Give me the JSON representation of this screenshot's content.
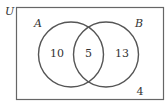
{
  "diagram": {
    "type": "venn",
    "universe": {
      "label": "U",
      "outside_count": "4"
    },
    "sets": [
      {
        "name": "A",
        "only_count": "10"
      },
      {
        "name": "B",
        "only_count": "13"
      }
    ],
    "intersection": {
      "sets": [
        "A",
        "B"
      ],
      "count": "5"
    },
    "colors": {
      "stroke": "#555555",
      "text": "#333333",
      "background": "#ffffff"
    }
  }
}
